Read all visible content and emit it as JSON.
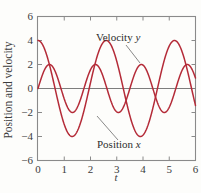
{
  "chart_data": {
    "type": "line",
    "title": "",
    "xlabel": "t",
    "ylabel": "Position and velocity",
    "xlim": [
      0,
      6
    ],
    "ylim": [
      -6,
      6
    ],
    "xticks": [
      "0",
      "1",
      "2",
      "3",
      "4",
      "5",
      "6"
    ],
    "xtick_values": [
      0,
      1,
      2,
      3,
      4,
      5,
      6
    ],
    "yticks": [
      "6",
      "4",
      "2",
      "0",
      "−2",
      "−4",
      "−6"
    ],
    "ytick_values": [
      6,
      4,
      2,
      0,
      -2,
      -4,
      -6
    ],
    "grid": false,
    "legend_position": "inline-annotations",
    "series": [
      {
        "name": "Velocity y",
        "label": "Velocity y",
        "color": "#b42b38",
        "amplitude": 4,
        "period": 2.6,
        "phase_deg": 0,
        "form": "4*cos(2*pi*t/2.6)",
        "x": [
          0.0,
          0.1,
          0.2,
          0.3,
          0.4,
          0.5,
          0.6,
          0.7,
          0.8,
          0.9,
          1.0,
          1.1,
          1.2,
          1.3,
          1.4,
          1.5,
          1.6,
          1.7,
          1.8,
          1.9,
          2.0,
          2.1,
          2.2,
          2.3,
          2.4,
          2.5,
          2.6,
          2.7,
          2.8,
          2.9,
          3.0,
          3.1,
          3.2,
          3.3,
          3.4,
          3.5,
          3.6,
          3.7,
          3.8,
          3.9,
          4.0,
          4.1,
          4.2,
          4.3,
          4.4,
          4.5,
          4.6,
          4.7,
          4.8,
          4.9,
          5.0,
          5.1,
          5.2,
          5.3,
          5.4,
          5.5,
          5.6,
          5.7,
          5.8,
          5.9,
          6.0
        ],
        "y": [
          4.0,
          3.88,
          3.53,
          2.98,
          2.26,
          1.42,
          0.48,
          -0.48,
          -1.42,
          -2.26,
          -2.98,
          -3.53,
          -3.88,
          -4.0,
          -3.88,
          -3.53,
          -2.98,
          -2.26,
          -1.42,
          -0.48,
          0.48,
          1.42,
          2.26,
          2.98,
          3.53,
          3.88,
          4.0,
          3.88,
          3.53,
          2.98,
          2.26,
          1.42,
          0.48,
          -0.48,
          -1.42,
          -2.26,
          -2.98,
          -3.53,
          -3.88,
          -4.0,
          -3.88,
          -3.53,
          -2.98,
          -2.26,
          -1.42,
          -0.48,
          0.48,
          1.42,
          2.26,
          2.98,
          3.53,
          3.88,
          4.0,
          3.88,
          3.53,
          2.98,
          2.26,
          1.42,
          0.48,
          -0.48,
          -1.42
        ]
      },
      {
        "name": "Position x",
        "label": "Position x",
        "color": "#b42b38",
        "amplitude": 2,
        "period": 1.75,
        "phase_deg": 0,
        "form": "2*sin(2*pi*t/1.75)",
        "x": [
          0.0,
          0.1,
          0.2,
          0.3,
          0.4,
          0.5,
          0.6,
          0.7,
          0.8,
          0.9,
          1.0,
          1.1,
          1.2,
          1.3,
          1.4,
          1.5,
          1.6,
          1.7,
          1.8,
          1.9,
          2.0,
          2.1,
          2.2,
          2.3,
          2.4,
          2.5,
          2.6,
          2.7,
          2.8,
          2.9,
          3.0,
          3.1,
          3.2,
          3.3,
          3.4,
          3.5,
          3.6,
          3.7,
          3.8,
          3.9,
          4.0,
          4.1,
          4.2,
          4.3,
          4.4,
          4.5,
          4.6,
          4.7,
          4.8,
          4.9,
          5.0,
          5.1,
          5.2,
          5.3,
          5.4,
          5.5,
          5.6,
          5.7,
          5.8,
          5.9,
          6.0
        ],
        "y": [
          0.0,
          0.7,
          1.29,
          1.72,
          1.96,
          1.98,
          1.79,
          1.41,
          0.9,
          0.31,
          -0.31,
          -0.9,
          -1.41,
          -1.79,
          -1.98,
          -1.96,
          -1.72,
          -1.29,
          -0.7,
          0.0,
          0.7,
          1.29,
          1.72,
          1.96,
          1.98,
          1.79,
          1.41,
          0.9,
          0.31,
          -0.31,
          -0.9,
          -1.41,
          -1.79,
          -1.98,
          -1.96,
          -1.72,
          -1.29,
          -0.7,
          0.0,
          0.7,
          1.29,
          1.72,
          1.96,
          1.98,
          1.79,
          1.41,
          0.9,
          0.31,
          -0.31,
          -0.9,
          -1.41,
          -1.79,
          -1.98,
          -1.96,
          -1.72,
          -1.29,
          -0.7,
          0.0,
          0.7,
          1.29,
          1.72
        ]
      }
    ],
    "annotations": [
      {
        "id": "velocity",
        "text_main": "Velocity",
        "text_var": "y",
        "text_x": 96,
        "text_y": 41,
        "leader_from_x": 126,
        "leader_from_y": 45,
        "leader_to_x": 140,
        "leader_to_y": 63
      },
      {
        "id": "position",
        "text_main": "Position",
        "text_var": "x",
        "text_x": 97,
        "text_y": 148,
        "leader_from_x": 118,
        "leader_from_y": 140,
        "leader_to_x": 97,
        "leader_to_y": 116
      }
    ],
    "colors": {
      "curve": "#b42b38",
      "frame": "#8a8a8a",
      "zero_line": "#7d7d7d",
      "text": "#3b3b3b",
      "background": "#fdfdfb"
    }
  }
}
